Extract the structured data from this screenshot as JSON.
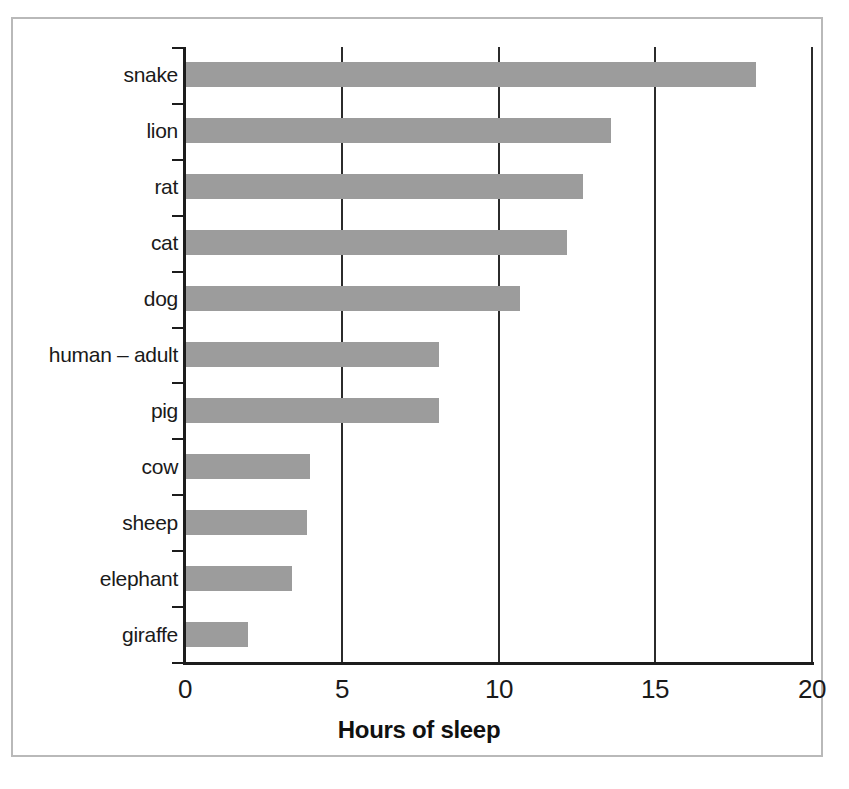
{
  "figure": {
    "title": "",
    "frame_color": "#b9b9b9",
    "background": "#ffffff"
  },
  "axis": {
    "x_title": "Hours of sleep",
    "y_title": "",
    "x_ticks": [
      "0",
      "5",
      "10",
      "15",
      "20"
    ]
  },
  "chart_data": {
    "type": "bar",
    "orientation": "horizontal",
    "title": "",
    "xlabel": "Hours of sleep",
    "ylabel": "",
    "xlim": [
      0,
      20
    ],
    "xticks": [
      0,
      5,
      10,
      15,
      20
    ],
    "grid": "vertical gridlines at each x tick",
    "legend": "none",
    "bar_color": "#9c9c9c",
    "categories": [
      "snake",
      "lion",
      "rat",
      "cat",
      "dog",
      "human – adult",
      "pig",
      "cow",
      "sheep",
      "elephant",
      "giraffe"
    ],
    "values": [
      18.2,
      13.6,
      12.7,
      12.2,
      10.7,
      8.1,
      8.1,
      4.0,
      3.9,
      3.4,
      2.0
    ],
    "series": [
      {
        "name": "Hours of sleep",
        "values": [
          18.2,
          13.6,
          12.7,
          12.2,
          10.7,
          8.1,
          8.1,
          4.0,
          3.9,
          3.4,
          2.0
        ]
      }
    ]
  }
}
